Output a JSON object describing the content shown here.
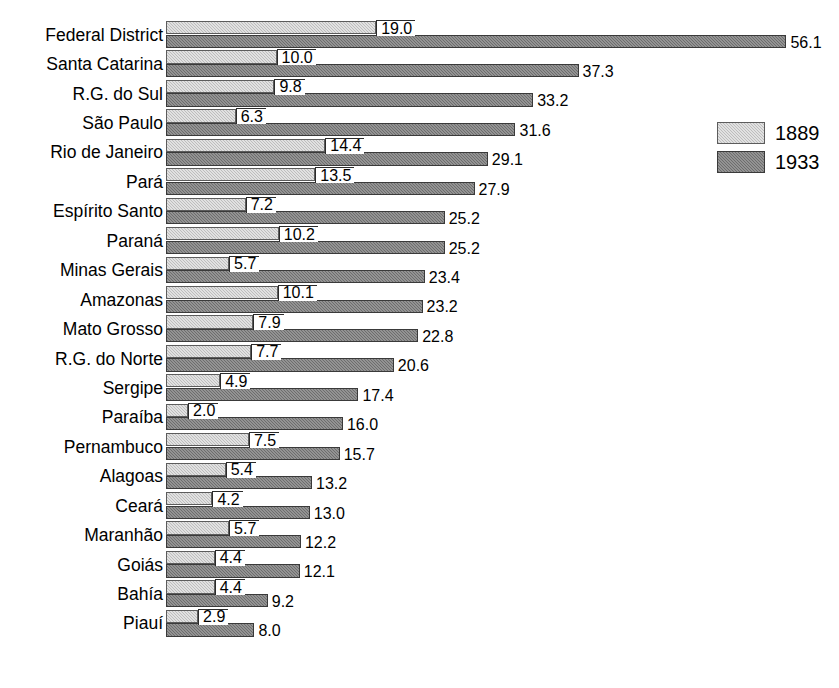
{
  "chart_data": {
    "type": "bar",
    "orientation": "horizontal",
    "title": "",
    "subtitle": "",
    "xlabel": "",
    "ylabel": "",
    "grid": false,
    "legend_position": "right",
    "xlim": [
      0,
      56.1
    ],
    "categories": [
      "Federal District",
      "Santa Catarina",
      "R.G. do Sul",
      "São Paulo",
      "Rio de Janeiro",
      "Pará",
      "Espírito Santo",
      "Paraná",
      "Minas Gerais",
      "Amazonas",
      "Mato Grosso",
      "R.G. do Norte",
      "Sergipe",
      "Paraíba",
      "Pernambuco",
      "Alagoas",
      "Ceará",
      "Maranhão",
      "Goiás",
      "Bahía",
      "Piauí"
    ],
    "series": [
      {
        "name": "1889",
        "color": "#bdbdbd",
        "values": [
          19.0,
          10.0,
          9.8,
          6.3,
          14.4,
          13.5,
          7.2,
          10.2,
          5.7,
          10.1,
          7.9,
          7.7,
          4.9,
          2.0,
          7.5,
          5.4,
          4.2,
          5.7,
          4.4,
          4.4,
          2.9
        ],
        "labels": [
          "19.0",
          "10.0",
          "9.8",
          "6.3",
          "14.4",
          "13.5",
          "7.2",
          "10.2",
          "5.7",
          "10.1",
          "7.9",
          "7.7",
          "4.9",
          "2.0",
          "7.5",
          "5.4",
          "4.2",
          "5.7",
          "4.4",
          "4.4",
          "2.9"
        ]
      },
      {
        "name": "1933",
        "color": "#6d6d6d",
        "values": [
          56.1,
          37.3,
          33.2,
          31.6,
          29.1,
          27.9,
          25.2,
          25.2,
          23.4,
          23.2,
          22.8,
          20.6,
          17.4,
          16.0,
          15.7,
          13.2,
          13.0,
          12.2,
          12.1,
          9.2,
          8.0
        ],
        "labels": [
          "56.1",
          "37.3",
          "33.2",
          "31.6",
          "29.1",
          "27.9",
          "25.2",
          "25.2",
          "23.4",
          "23.2",
          "22.8",
          "20.6",
          "17.4",
          "16.0",
          "15.7",
          "13.2",
          "13.0",
          "12.2",
          "12.1",
          "9.2",
          "8.0"
        ]
      }
    ]
  },
  "legend": {
    "items": [
      {
        "label": "1889",
        "swatch": "light-hatch-swatch"
      },
      {
        "label": "1933",
        "swatch": "dark-hatch-swatch"
      }
    ]
  }
}
